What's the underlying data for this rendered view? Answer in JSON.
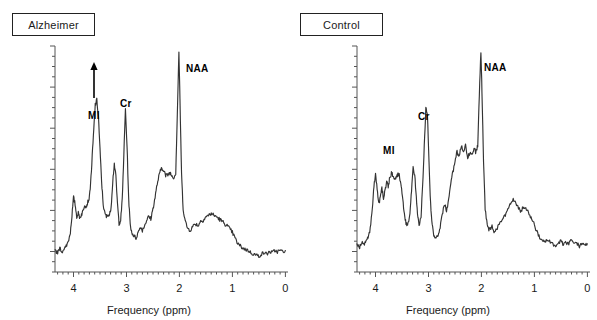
{
  "figure": {
    "type": "mrs-spectra-comparison",
    "background_color": "#ffffff",
    "trace_color": "#333333",
    "axis_color": "#555555"
  },
  "panels": [
    {
      "id": "alzheimer",
      "title": "Alzheimer",
      "axis_title": "Frequency (ppm)",
      "tick_labels": [
        "4",
        "3",
        "2",
        "1",
        "0"
      ],
      "peak_labels": [
        {
          "text": "MI",
          "ppm": 3.56,
          "label_x": 88,
          "label_y": 110
        },
        {
          "text": "Cr",
          "ppm": 3.02,
          "label_x": 120,
          "label_y": 98
        },
        {
          "text": "NAA",
          "ppm": 2.01,
          "label_x": 186,
          "label_y": 63
        }
      ],
      "annotation": {
        "type": "up-arrow",
        "meaning": "elevated MI",
        "x": 94,
        "y_top": 62,
        "y_bottom": 98
      }
    },
    {
      "id": "control",
      "title": "Control",
      "axis_title": "Frequency (ppm)",
      "tick_labels": [
        "4",
        "3",
        "2",
        "1",
        "0"
      ],
      "peak_labels": [
        {
          "text": "MI",
          "ppm": 3.56,
          "label_x": 84,
          "label_y": 145
        },
        {
          "text": "Cr",
          "ppm": 3.02,
          "label_x": 119,
          "label_y": 111
        },
        {
          "text": "NAA",
          "ppm": 2.01,
          "label_x": 185,
          "label_y": 62
        }
      ],
      "annotation": null
    }
  ],
  "chart_data": {
    "type": "line",
    "title": "",
    "xlabel": "Frequency (ppm)",
    "ylabel": "",
    "xlim": [
      4.35,
      -0.05
    ],
    "x_axis_reversed": true,
    "xticks": [
      4,
      3,
      2,
      1,
      0
    ],
    "xtick_labels": [
      "4",
      "3",
      "2",
      "1",
      "0"
    ],
    "yticks_labeled": false,
    "grid": false,
    "legend": "none",
    "series": [
      {
        "name": "Alzheimer",
        "panel": "alzheimer",
        "annotations": [
          "MI",
          "Cr",
          "NAA",
          "up-arrow above MI"
        ],
        "x": [
          4.35,
          4.3,
          4.26,
          4.22,
          4.18,
          4.14,
          4.1,
          4.06,
          4.03,
          4.0,
          3.97,
          3.94,
          3.91,
          3.88,
          3.85,
          3.82,
          3.79,
          3.76,
          3.73,
          3.7,
          3.67,
          3.64,
          3.61,
          3.59,
          3.56,
          3.53,
          3.5,
          3.47,
          3.44,
          3.41,
          3.38,
          3.35,
          3.32,
          3.29,
          3.26,
          3.23,
          3.2,
          3.17,
          3.14,
          3.11,
          3.08,
          3.05,
          3.02,
          2.99,
          2.96,
          2.93,
          2.9,
          2.86,
          2.82,
          2.78,
          2.74,
          2.7,
          2.66,
          2.62,
          2.58,
          2.54,
          2.5,
          2.46,
          2.42,
          2.38,
          2.34,
          2.3,
          2.26,
          2.22,
          2.18,
          2.14,
          2.1,
          2.07,
          2.04,
          2.01,
          1.99,
          1.96,
          1.93,
          1.89,
          1.85,
          1.8,
          1.75,
          1.7,
          1.65,
          1.6,
          1.55,
          1.5,
          1.45,
          1.4,
          1.35,
          1.3,
          1.25,
          1.2,
          1.15,
          1.1,
          1.05,
          1.0,
          0.95,
          0.9,
          0.85,
          0.8,
          0.75,
          0.7,
          0.65,
          0.6,
          0.55,
          0.5,
          0.45,
          0.4,
          0.35,
          0.3,
          0.25,
          0.2,
          0.15,
          0.1,
          0.05,
          0.0
        ],
        "y": [
          0.095,
          0.085,
          0.105,
          0.09,
          0.1,
          0.115,
          0.135,
          0.175,
          0.25,
          0.33,
          0.3,
          0.245,
          0.26,
          0.24,
          0.255,
          0.27,
          0.3,
          0.29,
          0.31,
          0.33,
          0.42,
          0.54,
          0.66,
          0.74,
          0.76,
          0.69,
          0.54,
          0.4,
          0.3,
          0.26,
          0.245,
          0.255,
          0.25,
          0.29,
          0.4,
          0.48,
          0.42,
          0.3,
          0.215,
          0.23,
          0.32,
          0.52,
          0.72,
          0.56,
          0.33,
          0.21,
          0.175,
          0.16,
          0.15,
          0.175,
          0.2,
          0.185,
          0.205,
          0.23,
          0.245,
          0.235,
          0.28,
          0.33,
          0.39,
          0.43,
          0.46,
          0.455,
          0.425,
          0.43,
          0.44,
          0.425,
          0.42,
          0.44,
          0.7,
          0.975,
          0.76,
          0.43,
          0.28,
          0.225,
          0.195,
          0.185,
          0.2,
          0.215,
          0.205,
          0.225,
          0.23,
          0.245,
          0.25,
          0.26,
          0.25,
          0.245,
          0.235,
          0.225,
          0.215,
          0.205,
          0.19,
          0.175,
          0.15,
          0.125,
          0.115,
          0.105,
          0.1,
          0.095,
          0.085,
          0.08,
          0.075,
          0.07,
          0.08,
          0.085,
          0.08,
          0.09,
          0.085,
          0.095,
          0.09,
          0.095,
          0.09,
          0.095
        ]
      },
      {
        "name": "Control",
        "panel": "control",
        "annotations": [
          "MI",
          "Cr",
          "NAA"
        ],
        "x": [
          4.35,
          4.3,
          4.26,
          4.22,
          4.18,
          4.14,
          4.1,
          4.06,
          4.03,
          4.0,
          3.97,
          3.94,
          3.91,
          3.88,
          3.85,
          3.82,
          3.79,
          3.76,
          3.73,
          3.7,
          3.67,
          3.64,
          3.61,
          3.59,
          3.56,
          3.53,
          3.5,
          3.47,
          3.44,
          3.41,
          3.38,
          3.35,
          3.32,
          3.29,
          3.26,
          3.23,
          3.2,
          3.17,
          3.14,
          3.11,
          3.08,
          3.05,
          3.02,
          2.99,
          2.96,
          2.93,
          2.9,
          2.86,
          2.82,
          2.78,
          2.74,
          2.7,
          2.66,
          2.62,
          2.58,
          2.54,
          2.5,
          2.46,
          2.42,
          2.38,
          2.34,
          2.3,
          2.26,
          2.22,
          2.18,
          2.14,
          2.1,
          2.07,
          2.04,
          2.01,
          1.99,
          1.96,
          1.93,
          1.89,
          1.85,
          1.8,
          1.75,
          1.7,
          1.65,
          1.6,
          1.55,
          1.5,
          1.45,
          1.4,
          1.35,
          1.3,
          1.25,
          1.2,
          1.15,
          1.1,
          1.05,
          1.0,
          0.95,
          0.9,
          0.85,
          0.8,
          0.75,
          0.7,
          0.65,
          0.6,
          0.55,
          0.5,
          0.45,
          0.4,
          0.35,
          0.3,
          0.25,
          0.2,
          0.15,
          0.1,
          0.05,
          0.0
        ],
        "y": [
          0.12,
          0.11,
          0.135,
          0.12,
          0.14,
          0.15,
          0.19,
          0.28,
          0.38,
          0.43,
          0.37,
          0.3,
          0.33,
          0.37,
          0.33,
          0.36,
          0.4,
          0.375,
          0.42,
          0.44,
          0.425,
          0.405,
          0.42,
          0.43,
          0.435,
          0.4,
          0.35,
          0.285,
          0.23,
          0.205,
          0.215,
          0.26,
          0.36,
          0.47,
          0.43,
          0.33,
          0.24,
          0.205,
          0.25,
          0.38,
          0.56,
          0.72,
          0.7,
          0.48,
          0.3,
          0.205,
          0.165,
          0.15,
          0.16,
          0.2,
          0.25,
          0.3,
          0.275,
          0.315,
          0.39,
          0.44,
          0.49,
          0.53,
          0.51,
          0.555,
          0.53,
          0.56,
          0.5,
          0.53,
          0.52,
          0.545,
          0.53,
          0.56,
          0.78,
          0.98,
          0.8,
          0.48,
          0.28,
          0.205,
          0.185,
          0.2,
          0.175,
          0.195,
          0.215,
          0.23,
          0.25,
          0.275,
          0.3,
          0.32,
          0.3,
          0.285,
          0.27,
          0.29,
          0.275,
          0.255,
          0.235,
          0.21,
          0.175,
          0.15,
          0.14,
          0.13,
          0.145,
          0.135,
          0.12,
          0.115,
          0.125,
          0.135,
          0.12,
          0.13,
          0.125,
          0.14,
          0.13,
          0.125,
          0.115,
          0.13,
          0.12,
          0.125
        ]
      }
    ]
  }
}
